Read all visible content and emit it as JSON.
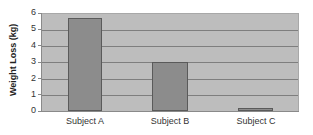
{
  "chart_data": {
    "type": "bar",
    "title": "",
    "xlabel": "",
    "ylabel": "Weight Loss (kg)",
    "categories": [
      "Subject A",
      "Subject B",
      "Subject C"
    ],
    "values": [
      5.7,
      3.0,
      0.2
    ],
    "ylim": [
      0,
      6
    ],
    "yticks": [
      "0",
      "1",
      "2",
      "3",
      "4",
      "5",
      "6"
    ],
    "grid": true,
    "legend": null,
    "colors": {
      "bar": "#8c8c8c",
      "bar_border": "#5a5a5a",
      "plot_background": "#bdbdbd",
      "gridline": "#7e7e7e"
    }
  }
}
